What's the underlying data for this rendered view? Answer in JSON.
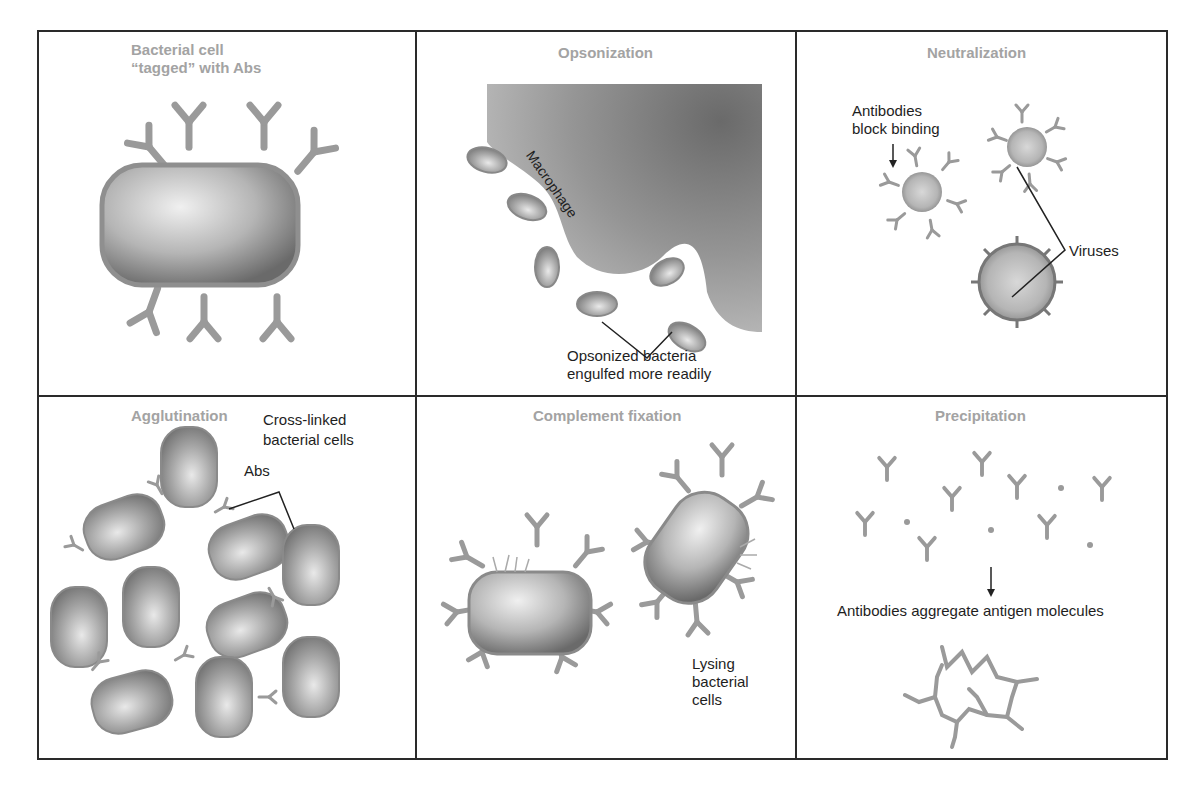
{
  "figure": {
    "layout": "2x3 grid of panels",
    "colors": {
      "border": "#2a2a2a",
      "panel_title": "#a3a3a3",
      "label_text": "#1e1e1e",
      "antibody": "#9a9a9a",
      "cell_fill_dark": "#6e6e6e",
      "cell_fill_light": "#e8e8e8",
      "macrophage": "#8a8a8a"
    },
    "panels": [
      {
        "id": "tagged",
        "title_line1": "Bacterial cell",
        "title_line2": "“tagged” with Abs",
        "labels": []
      },
      {
        "id": "opsonization",
        "title": "Opsonization",
        "labels": {
          "macrophage": "Macrophage",
          "bacteria_line1": "Opsonized bacteria",
          "bacteria_line2": "engulfed more readily"
        }
      },
      {
        "id": "neutralization",
        "title": "Neutralization",
        "labels": {
          "antibodies_line1": "Antibodies",
          "antibodies_line2": "block binding",
          "viruses": "Viruses"
        }
      },
      {
        "id": "agglutination",
        "title": "Agglutination",
        "labels": {
          "crosslinked_line1": "Cross-linked",
          "crosslinked_line2": "bacterial cells",
          "abs": "Abs"
        }
      },
      {
        "id": "complement",
        "title": "Complement fixation",
        "labels": {
          "lysing_line1": "Lysing",
          "lysing_line2": "bacterial",
          "lysing_line3": "cells"
        }
      },
      {
        "id": "precipitation",
        "title": "Precipitation",
        "labels": {
          "aggregate": "Antibodies aggregate antigen molecules"
        }
      }
    ]
  }
}
